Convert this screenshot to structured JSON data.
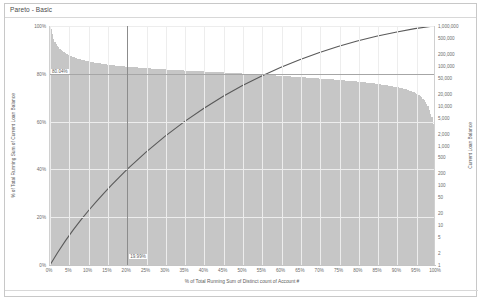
{
  "window": {
    "title": "Pareto - Basic"
  },
  "chart_data": {
    "type": "bar",
    "title": "Pareto - Basic",
    "xlabel": "% of Total Running Sum of Distinct count of Account #",
    "ylabel": "% of Total Running Sum of Current Loan Balance",
    "y2label": "Current Loan Balance",
    "grid": true,
    "legend": "none",
    "x_ticks": [
      "0%",
      "5%",
      "10%",
      "15%",
      "20%",
      "25%",
      "30%",
      "35%",
      "40%",
      "45%",
      "50%",
      "55%",
      "60%",
      "65%",
      "70%",
      "75%",
      "80%",
      "85%",
      "90%",
      "95%",
      "100%"
    ],
    "y_left_ticks": [
      "0%",
      "20%",
      "40%",
      "60%",
      "80%",
      "100%"
    ],
    "ylim": [
      0,
      100
    ],
    "y_right_ticks": [
      "1",
      "2",
      "5",
      "10",
      "20",
      "50",
      "100",
      "200",
      "500",
      "1,000",
      "2,000",
      "5,000",
      "10,000",
      "20,000",
      "50,000",
      "100,000",
      "200,000",
      "500,000",
      "1,000,000"
    ],
    "y_right_scale": "log",
    "y2lim": [
      1,
      1000000
    ],
    "reference_lines": [
      {
        "name": "pareto-80-line",
        "orientation": "horizontal",
        "value": 80.04,
        "label": "80.04%"
      },
      {
        "name": "account-share-line",
        "orientation": "vertical",
        "value": 20.0,
        "label": "19.99%"
      }
    ],
    "series": [
      {
        "name": "Current Loan Balance",
        "type": "bar",
        "axis": "right",
        "color": "#c6c6c6",
        "x": [
          0,
          1,
          2,
          3,
          4,
          5,
          6,
          7,
          8,
          9,
          10,
          12,
          14,
          16,
          18,
          20,
          25,
          30,
          35,
          40,
          45,
          50,
          55,
          60,
          65,
          70,
          75,
          80,
          85,
          90,
          92,
          94,
          96,
          97,
          98,
          99,
          99.5,
          100
        ],
        "values": [
          1000000,
          420000,
          300000,
          240000,
          205000,
          182000,
          165000,
          152000,
          143000,
          135000,
          128000,
          118000,
          110000,
          104000,
          99000,
          95000,
          87000,
          81000,
          76000,
          72000,
          68000,
          64000,
          60000,
          56000,
          52000,
          48000,
          44000,
          40000,
          35000,
          29000,
          26000,
          22000,
          17000,
          13000,
          9000,
          4500,
          2000,
          400
        ]
      },
      {
        "name": "% of Total Running Sum of Current Loan Balance",
        "type": "line",
        "axis": "left",
        "color": "#5a5a5a",
        "x": [
          0,
          2,
          4,
          6,
          8,
          10,
          12,
          14,
          16,
          18,
          20,
          25,
          30,
          35,
          40,
          45,
          50,
          55,
          60,
          65,
          70,
          75,
          80,
          85,
          90,
          95,
          100
        ],
        "values": [
          0,
          5.2,
          10.1,
          14.6,
          18.8,
          22.7,
          26.4,
          30.0,
          33.4,
          36.7,
          39.9,
          47.2,
          53.9,
          60.0,
          65.5,
          70.5,
          75.0,
          79.0,
          82.6,
          85.9,
          88.8,
          91.4,
          93.7,
          95.7,
          97.4,
          98.9,
          100
        ]
      }
    ]
  }
}
